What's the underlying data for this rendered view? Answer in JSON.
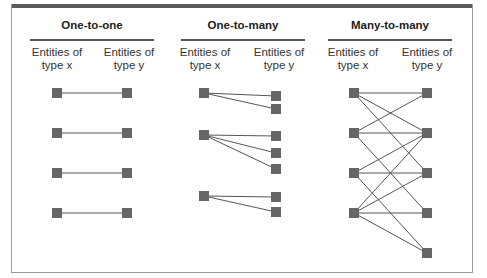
{
  "panels": [
    {
      "title": "One-to-one",
      "left_label": "Entities of type x",
      "right_label": "Entities of type y",
      "left_label_lines": [
        "Entities of",
        "type x"
      ],
      "right_label_lines": [
        "Entities of",
        "type y"
      ],
      "x_nodes": 4,
      "y_nodes": 4,
      "edges": [
        [
          1,
          1
        ],
        [
          2,
          2
        ],
        [
          3,
          3
        ],
        [
          4,
          4
        ]
      ]
    },
    {
      "title": "One-to-many",
      "left_label_lines": [
        "Entities of",
        "type x"
      ],
      "right_label_lines": [
        "Entities of",
        "type y"
      ],
      "x_nodes": 3,
      "y_nodes": 7,
      "edges": [
        [
          1,
          1
        ],
        [
          1,
          2
        ],
        [
          2,
          3
        ],
        [
          2,
          4
        ],
        [
          2,
          5
        ],
        [
          3,
          6
        ],
        [
          3,
          7
        ]
      ]
    },
    {
      "title": "Many-to-many",
      "left_label_lines": [
        "Entities of",
        "type x"
      ],
      "right_label_lines": [
        "Entities of",
        "type y"
      ],
      "x_nodes": 4,
      "y_nodes": 5,
      "edges": [
        [
          1,
          1
        ],
        [
          1,
          2
        ],
        [
          1,
          3
        ],
        [
          2,
          1
        ],
        [
          2,
          2
        ],
        [
          2,
          4
        ],
        [
          3,
          2
        ],
        [
          3,
          3
        ],
        [
          3,
          5
        ],
        [
          4,
          2
        ],
        [
          4,
          3
        ],
        [
          4,
          4
        ],
        [
          4,
          5
        ]
      ]
    }
  ],
  "colors": {
    "node": "#666666",
    "edge": "#555555",
    "frame": "#9a9a9a",
    "topbar": "#5a5a5a"
  }
}
